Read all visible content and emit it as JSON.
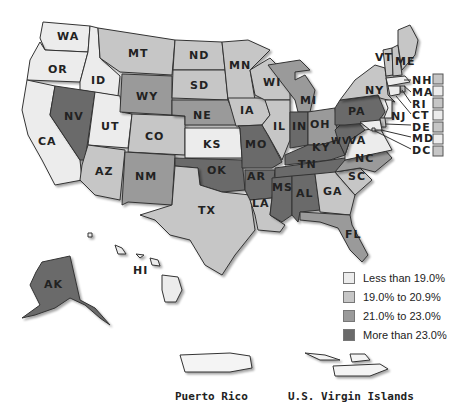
{
  "legend": {
    "items": [
      {
        "label": "Less than 19.0%",
        "color": "#ececec"
      },
      {
        "label": "19.0% to 20.9%",
        "color": "#c6c6c6"
      },
      {
        "label": "21.0% to 23.0%",
        "color": "#9a9a9a"
      },
      {
        "label": "More than 23.0%",
        "color": "#6a6a6a"
      }
    ]
  },
  "territories": {
    "puerto_rico": "Puerto Rico",
    "virgin_islands": "U.S. Virgin Islands"
  },
  "states": {
    "WA": {
      "label": "WA",
      "category": 0
    },
    "OR": {
      "label": "OR",
      "category": 0
    },
    "CA": {
      "label": "CA",
      "category": 0
    },
    "ID": {
      "label": "ID",
      "category": 0
    },
    "NV": {
      "label": "NV",
      "category": 3
    },
    "UT": {
      "label": "UT",
      "category": 0
    },
    "AZ": {
      "label": "AZ",
      "category": 1
    },
    "MT": {
      "label": "MT",
      "category": 1
    },
    "WY": {
      "label": "WY",
      "category": 2
    },
    "CO": {
      "label": "CO",
      "category": 1
    },
    "NM": {
      "label": "NM",
      "category": 2
    },
    "ND": {
      "label": "ND",
      "category": 1
    },
    "SD": {
      "label": "SD",
      "category": 1
    },
    "NE": {
      "label": "NE",
      "category": 2
    },
    "KS": {
      "label": "KS",
      "category": 0
    },
    "OK": {
      "label": "OK",
      "category": 3
    },
    "TX": {
      "label": "TX",
      "category": 1
    },
    "MN": {
      "label": "MN",
      "category": 1
    },
    "IA": {
      "label": "IA",
      "category": 1
    },
    "MO": {
      "label": "MO",
      "category": 3
    },
    "AR": {
      "label": "AR",
      "category": 3
    },
    "LA": {
      "label": "LA",
      "category": 1
    },
    "WI": {
      "label": "WI",
      "category": 1
    },
    "IL": {
      "label": "IL",
      "category": 1
    },
    "MI": {
      "label": "MI",
      "category": 2
    },
    "IN": {
      "label": "IN",
      "category": 3
    },
    "OH": {
      "label": "OH",
      "category": 2
    },
    "KY": {
      "label": "KY",
      "category": 3
    },
    "TN": {
      "label": "TN",
      "category": 3
    },
    "MS": {
      "label": "MS",
      "category": 3
    },
    "AL": {
      "label": "AL",
      "category": 3
    },
    "GA": {
      "label": "GA",
      "category": 1
    },
    "FL": {
      "label": "FL",
      "category": 2
    },
    "SC": {
      "label": "SC",
      "category": 1
    },
    "NC": {
      "label": "NC",
      "category": 2
    },
    "VA": {
      "label": "VA",
      "category": 0
    },
    "WV": {
      "label": "WV",
      "category": 3
    },
    "PA": {
      "label": "PA",
      "category": 3
    },
    "NY": {
      "label": "NY",
      "category": 1
    },
    "VT": {
      "label": "VT",
      "category": 1
    },
    "ME": {
      "label": "ME",
      "category": 1
    },
    "NH": {
      "label": "NH",
      "category": 1
    },
    "MA": {
      "label": "MA",
      "category": 0
    },
    "RI": {
      "label": "RI",
      "category": 1
    },
    "CT": {
      "label": "CT",
      "category": 0
    },
    "NJ": {
      "label": "NJ",
      "category": 0
    },
    "DE": {
      "label": "DE",
      "category": 1
    },
    "MD": {
      "label": "MD",
      "category": 0
    },
    "DC": {
      "label": "DC",
      "category": 1
    },
    "AK": {
      "label": "AK",
      "category": 3
    },
    "HI": {
      "label": "HI",
      "category": 0
    }
  }
}
